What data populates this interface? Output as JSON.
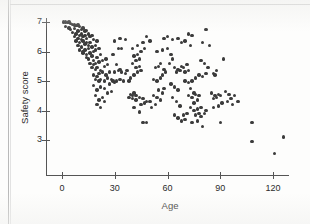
{
  "figure": {
    "marker_color": "#3b3b3b",
    "axis_color": "#555555",
    "background": "#fdfdfc"
  },
  "chart_data": {
    "type": "scatter",
    "title": "",
    "xlabel": "Age",
    "ylabel": "Safety score",
    "xlim": [
      -4,
      134
    ],
    "ylim": [
      2.3,
      7.15
    ],
    "xticks": [
      0,
      30,
      60,
      90,
      120
    ],
    "yticks": [
      3,
      4,
      5,
      6,
      7
    ],
    "xtick_labels": [
      "0",
      "30",
      "60",
      "90",
      "120"
    ],
    "ytick_labels": [
      "3",
      "4",
      "5",
      "6",
      "7"
    ],
    "grid": false,
    "legend": null,
    "n_points": 208,
    "trend": "negative",
    "points": [
      [
        1,
        7.0
      ],
      [
        2,
        7.0
      ],
      [
        3,
        6.98
      ],
      [
        4,
        7.0
      ],
      [
        5,
        6.95
      ],
      [
        6,
        6.92
      ],
      [
        7,
        6.9
      ],
      [
        2,
        6.85
      ],
      [
        4,
        6.8
      ],
      [
        5,
        6.75
      ],
      [
        7,
        6.78
      ],
      [
        8,
        6.88
      ],
      [
        9,
        6.9
      ],
      [
        10,
        6.85
      ],
      [
        6,
        6.65
      ],
      [
        8,
        6.6
      ],
      [
        9,
        6.7
      ],
      [
        11,
        6.75
      ],
      [
        12,
        6.8
      ],
      [
        13,
        6.7
      ],
      [
        14,
        6.72
      ],
      [
        7,
        6.5
      ],
      [
        9,
        6.45
      ],
      [
        10,
        6.55
      ],
      [
        11,
        6.6
      ],
      [
        12,
        6.5
      ],
      [
        13,
        6.55
      ],
      [
        15,
        6.6
      ],
      [
        8,
        6.35
      ],
      [
        10,
        6.3
      ],
      [
        11,
        6.4
      ],
      [
        12,
        6.35
      ],
      [
        14,
        6.45
      ],
      [
        16,
        6.5
      ],
      [
        17,
        6.55
      ],
      [
        9,
        6.2
      ],
      [
        11,
        6.15
      ],
      [
        13,
        6.25
      ],
      [
        14,
        6.3
      ],
      [
        15,
        6.2
      ],
      [
        16,
        6.3
      ],
      [
        18,
        6.4
      ],
      [
        10,
        6.05
      ],
      [
        12,
        6.0
      ],
      [
        13,
        6.05
      ],
      [
        15,
        6.1
      ],
      [
        17,
        6.15
      ],
      [
        19,
        6.2
      ],
      [
        20,
        6.35
      ],
      [
        12,
        5.95
      ],
      [
        14,
        5.9
      ],
      [
        16,
        5.95
      ],
      [
        18,
        6.0
      ],
      [
        19,
        6.05
      ],
      [
        21,
        6.1
      ],
      [
        14,
        5.8
      ],
      [
        15,
        5.75
      ],
      [
        17,
        5.85
      ],
      [
        18,
        5.7
      ],
      [
        20,
        5.8
      ],
      [
        22,
        5.9
      ],
      [
        16,
        5.6
      ],
      [
        18,
        5.55
      ],
      [
        19,
        5.6
      ],
      [
        21,
        5.65
      ],
      [
        23,
        5.7
      ],
      [
        25,
        5.75
      ],
      [
        17,
        5.45
      ],
      [
        19,
        5.4
      ],
      [
        20,
        5.45
      ],
      [
        22,
        5.35
      ],
      [
        24,
        5.5
      ],
      [
        26,
        5.55
      ],
      [
        18,
        5.2
      ],
      [
        20,
        5.15
      ],
      [
        21,
        5.25
      ],
      [
        23,
        5.3
      ],
      [
        25,
        5.2
      ],
      [
        27,
        5.3
      ],
      [
        19,
        5.05
      ],
      [
        21,
        5.0
      ],
      [
        22,
        5.05
      ],
      [
        24,
        5.0
      ],
      [
        26,
        5.1
      ],
      [
        28,
        5.05
      ],
      [
        18,
        4.85
      ],
      [
        20,
        4.7
      ],
      [
        22,
        4.8
      ],
      [
        24,
        4.75
      ],
      [
        27,
        4.9
      ],
      [
        29,
        5.0
      ],
      [
        19,
        4.5
      ],
      [
        21,
        4.35
      ],
      [
        23,
        4.45
      ],
      [
        20,
        4.2
      ],
      [
        22,
        4.1
      ],
      [
        24,
        4.3
      ],
      [
        26,
        4.6
      ],
      [
        28,
        4.65
      ],
      [
        30,
        4.95
      ],
      [
        31,
        5.0
      ],
      [
        33,
        5.05
      ],
      [
        35,
        5.0
      ],
      [
        30,
        5.3
      ],
      [
        32,
        5.35
      ],
      [
        34,
        5.3
      ],
      [
        36,
        5.25
      ],
      [
        33,
        5.4
      ],
      [
        31,
        5.55
      ],
      [
        29,
        5.9
      ],
      [
        32,
        6.1
      ],
      [
        30,
        6.35
      ],
      [
        33,
        6.45
      ],
      [
        36,
        6.4
      ],
      [
        34,
        6.1
      ],
      [
        37,
        5.35
      ],
      [
        38,
        5.0
      ],
      [
        39,
        4.55
      ],
      [
        40,
        4.5
      ],
      [
        41,
        4.6
      ],
      [
        42,
        4.5
      ],
      [
        38,
        4.45
      ],
      [
        40,
        4.4
      ],
      [
        42,
        4.35
      ],
      [
        44,
        4.45
      ],
      [
        46,
        4.4
      ],
      [
        48,
        4.3
      ],
      [
        39,
        5.1
      ],
      [
        41,
        5.2
      ],
      [
        43,
        5.3
      ],
      [
        45,
        5.35
      ],
      [
        42,
        5.45
      ],
      [
        44,
        5.5
      ],
      [
        40,
        5.6
      ],
      [
        42,
        5.7
      ],
      [
        44,
        5.75
      ],
      [
        41,
        5.85
      ],
      [
        43,
        5.9
      ],
      [
        45,
        6.0
      ],
      [
        40,
        6.1
      ],
      [
        43,
        6.2
      ],
      [
        46,
        6.3
      ],
      [
        48,
        6.5
      ],
      [
        50,
        6.35
      ],
      [
        47,
        6.1
      ],
      [
        41,
        4.1
      ],
      [
        44,
        3.95
      ],
      [
        46,
        3.6
      ],
      [
        48,
        3.6
      ],
      [
        45,
        4.2
      ],
      [
        47,
        4.25
      ],
      [
        50,
        4.3
      ],
      [
        52,
        4.5
      ],
      [
        54,
        4.45
      ],
      [
        56,
        4.35
      ],
      [
        53,
        4.2
      ],
      [
        51,
        4.1
      ],
      [
        52,
        5.05
      ],
      [
        54,
        5.0
      ],
      [
        56,
        5.1
      ],
      [
        58,
        4.75
      ],
      [
        55,
        4.7
      ],
      [
        57,
        4.6
      ],
      [
        53,
        5.45
      ],
      [
        55,
        5.5
      ],
      [
        58,
        5.4
      ],
      [
        56,
        5.6
      ],
      [
        59,
        5.3
      ],
      [
        57,
        5.2
      ],
      [
        54,
        6.0
      ],
      [
        57,
        6.05
      ],
      [
        60,
        6.1
      ],
      [
        62,
        5.9
      ],
      [
        63,
        5.75
      ],
      [
        61,
        5.6
      ],
      [
        58,
        6.45
      ],
      [
        60,
        6.5
      ],
      [
        63,
        6.4
      ],
      [
        64,
        5.45
      ],
      [
        66,
        5.4
      ],
      [
        65,
        5.3
      ],
      [
        62,
        4.9
      ],
      [
        64,
        4.8
      ],
      [
        66,
        4.7
      ],
      [
        63,
        4.45
      ],
      [
        65,
        4.3
      ],
      [
        67,
        4.15
      ],
      [
        64,
        3.85
      ],
      [
        66,
        3.75
      ],
      [
        68,
        3.65
      ],
      [
        70,
        3.7
      ],
      [
        69,
        3.85
      ],
      [
        71,
        3.9
      ],
      [
        67,
        5.35
      ],
      [
        69,
        5.45
      ],
      [
        68,
        5.5
      ],
      [
        70,
        5.3
      ],
      [
        72,
        5.35
      ],
      [
        71,
        5.55
      ],
      [
        68,
        6.3
      ],
      [
        70,
        6.35
      ],
      [
        73,
        6.2
      ],
      [
        66,
        6.45
      ],
      [
        72,
        6.6
      ],
      [
        74,
        6.55
      ],
      [
        70,
        5.0
      ],
      [
        72,
        4.95
      ],
      [
        74,
        5.0
      ],
      [
        76,
        5.1
      ],
      [
        73,
        4.75
      ],
      [
        75,
        4.6
      ],
      [
        72,
        4.5
      ],
      [
        74,
        4.45
      ],
      [
        76,
        4.55
      ],
      [
        78,
        4.5
      ],
      [
        77,
        4.35
      ],
      [
        75,
        4.25
      ],
      [
        73,
        4.1
      ],
      [
        75,
        4.0
      ],
      [
        77,
        4.05
      ],
      [
        79,
        4.1
      ],
      [
        78,
        3.9
      ],
      [
        76,
        3.85
      ],
      [
        74,
        3.6
      ],
      [
        77,
        3.65
      ],
      [
        79,
        3.8
      ],
      [
        80,
        3.45
      ],
      [
        81,
        3.9
      ],
      [
        82,
        4.0
      ],
      [
        78,
        5.2
      ],
      [
        80,
        5.15
      ],
      [
        82,
        5.25
      ],
      [
        81,
        5.6
      ],
      [
        79,
        5.7
      ],
      [
        83,
        5.45
      ],
      [
        80,
        6.3
      ],
      [
        82,
        6.75
      ],
      [
        84,
        6.2
      ],
      [
        86,
        5.25
      ],
      [
        88,
        5.35
      ],
      [
        87,
        5.2
      ],
      [
        85,
        4.6
      ],
      [
        87,
        4.5
      ],
      [
        89,
        4.55
      ],
      [
        86,
        4.4
      ],
      [
        88,
        4.45
      ],
      [
        90,
        4.5
      ],
      [
        86,
        4.1
      ],
      [
        89,
        4.15
      ],
      [
        91,
        4.25
      ],
      [
        92,
        5.75
      ],
      [
        93,
        4.65
      ],
      [
        95,
        4.55
      ],
      [
        90,
        3.6
      ],
      [
        94,
        4.3
      ],
      [
        96,
        4.4
      ],
      [
        98,
        4.5
      ],
      [
        97,
        4.2
      ],
      [
        100,
        4.3
      ],
      [
        108,
        3.6
      ],
      [
        108,
        2.95
      ],
      [
        121,
        2.55
      ],
      [
        126,
        3.1
      ]
    ]
  }
}
